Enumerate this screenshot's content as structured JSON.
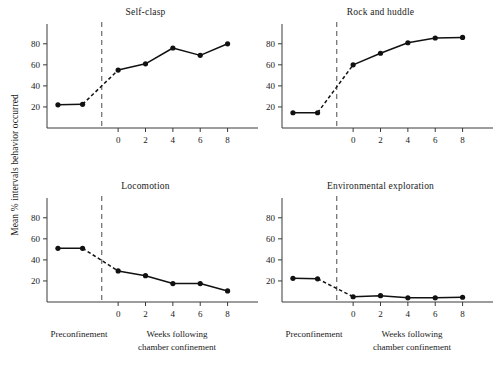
{
  "figure": {
    "y_axis_label": "Mean % intervals behavior occurred",
    "preconfinement_caption": "Preconfinement",
    "postconfinement_caption_line1": "Weeks following",
    "postconfinement_caption_line2": "chamber confinement",
    "ink_color": "#111111",
    "axis_color": "#3a3a3a",
    "confinement_marker_color": "#6b6b6b",
    "background_color": "#ffffff"
  },
  "chart_data": [
    {
      "type": "line",
      "title": "Self-clasp",
      "panel": "top-left",
      "xlabel": "Weeks following chamber confinement",
      "ylabel": "Mean % intervals behavior occurred",
      "ylim": [
        0,
        95
      ],
      "yticks": [
        20,
        40,
        60,
        80
      ],
      "xticks": [
        0,
        2,
        4,
        6,
        8
      ],
      "xtick_labels": [
        "0",
        "2",
        "4",
        "6",
        "8"
      ],
      "xlim": [
        -5.2,
        9.2
      ],
      "grid": false,
      "legend": "none",
      "confinement_divider_x": -1.2,
      "preconfinement_x": [
        -4.4,
        -2.6
      ],
      "preconfinement_values": [
        22,
        22.5
      ],
      "x": [
        0,
        2,
        4,
        6,
        8
      ],
      "values": [
        55,
        61,
        76,
        69,
        80
      ]
    },
    {
      "type": "line",
      "title": "Rock and huddle",
      "panel": "top-right",
      "xlabel": "Weeks following chamber confinement",
      "ylabel": "Mean % intervals behavior occurred",
      "ylim": [
        0,
        95
      ],
      "yticks": [
        20,
        40,
        60,
        80
      ],
      "xticks": [
        0,
        2,
        4,
        6,
        8
      ],
      "xtick_labels": [
        "0",
        "2",
        "4",
        "6",
        "8"
      ],
      "xlim": [
        -5.2,
        9.2
      ],
      "grid": false,
      "legend": "none",
      "confinement_divider_x": -1.2,
      "preconfinement_x": [
        -4.4,
        -2.6
      ],
      "preconfinement_values": [
        14.5,
        14.5
      ],
      "x": [
        0,
        2,
        4,
        6,
        8
      ],
      "values": [
        60,
        71,
        81,
        85.5,
        86
      ]
    },
    {
      "type": "line",
      "title": "Locomotion",
      "panel": "bottom-left",
      "xlabel": "Weeks following chamber confinement",
      "ylabel": "Mean % intervals behavior occurred",
      "ylim": [
        0,
        95
      ],
      "yticks": [
        20,
        40,
        60,
        80
      ],
      "xticks": [
        0,
        2,
        4,
        6,
        8
      ],
      "xtick_labels": [
        "0",
        "2",
        "4",
        "6",
        "8"
      ],
      "xlim": [
        -5.2,
        9.2
      ],
      "grid": false,
      "legend": "none",
      "confinement_divider_x": -1.2,
      "preconfinement_x": [
        -4.4,
        -2.6
      ],
      "preconfinement_values": [
        51,
        51
      ],
      "x": [
        0,
        2,
        4,
        6,
        8
      ],
      "values": [
        29.5,
        25,
        17.5,
        17.5,
        10.5
      ]
    },
    {
      "type": "line",
      "title": "Environmental exploration",
      "panel": "bottom-right",
      "xlabel": "Weeks following chamber confinement",
      "ylabel": "Mean % intervals behavior occurred",
      "ylim": [
        0,
        95
      ],
      "yticks": [
        20,
        40,
        60,
        80
      ],
      "xticks": [
        0,
        2,
        4,
        6,
        8
      ],
      "xtick_labels": [
        "0",
        "2",
        "4",
        "6",
        "8"
      ],
      "xlim": [
        -5.2,
        9.2
      ],
      "grid": false,
      "legend": "none",
      "confinement_divider_x": -1.2,
      "preconfinement_x": [
        -4.4,
        -2.6
      ],
      "preconfinement_values": [
        22.5,
        22
      ],
      "x": [
        0,
        2,
        4,
        6,
        8
      ],
      "values": [
        5,
        6,
        4,
        4,
        4.5
      ]
    }
  ]
}
